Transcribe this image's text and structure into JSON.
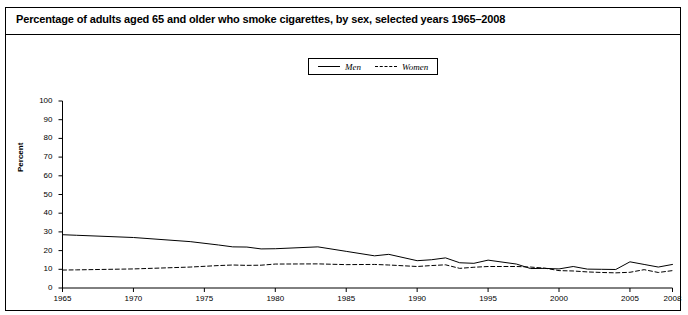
{
  "figure": {
    "title": "Percentage of adults aged 65 and older who smoke cigarettes, by sex, selected years 1965–2008"
  },
  "legend": {
    "position": "top-center",
    "entries": [
      {
        "label": "Men",
        "style": "solid",
        "icon": "solid-line-icon"
      },
      {
        "label": "Women",
        "style": "dashed",
        "icon": "dashed-line-icon"
      }
    ]
  },
  "axes": {
    "ylabel": "Percent",
    "yticks": [
      "0",
      "10",
      "20",
      "30",
      "40",
      "50",
      "60",
      "70",
      "80",
      "90",
      "100"
    ],
    "xticks": [
      "1965",
      "1970",
      "1975",
      "1980",
      "1985",
      "1990",
      "1995",
      "2000",
      "2005",
      "2008"
    ]
  },
  "chart_data": {
    "type": "line",
    "title": "Percentage of adults aged 65 and older who smoke cigarettes, by sex, selected years 1965–2008",
    "xlabel": "",
    "ylabel": "Percent",
    "xlim": [
      1965,
      2008
    ],
    "ylim": [
      0,
      100
    ],
    "ytick_values": [
      0,
      10,
      20,
      30,
      40,
      50,
      60,
      70,
      80,
      90,
      100
    ],
    "xtick_values": [
      1965,
      1970,
      1975,
      1980,
      1985,
      1990,
      1995,
      2000,
      2005,
      2008
    ],
    "grid": false,
    "legend_position": "top-center",
    "x": [
      1965,
      1966,
      1970,
      1974,
      1976,
      1977,
      1978,
      1979,
      1980,
      1983,
      1985,
      1987,
      1988,
      1990,
      1991,
      1992,
      1993,
      1994,
      1995,
      1997,
      1998,
      1999,
      2000,
      2001,
      2002,
      2003,
      2004,
      2005,
      2006,
      2007,
      2008
    ],
    "series": [
      {
        "name": "Men",
        "style": "solid",
        "color": "#000000",
        "values": [
          28.5,
          28.2,
          27.0,
          24.8,
          23.0,
          22.0,
          21.9,
          20.9,
          21.0,
          22.0,
          19.6,
          17.2,
          18.0,
          14.6,
          15.1,
          16.1,
          13.5,
          13.2,
          14.9,
          12.8,
          10.4,
          10.5,
          10.2,
          11.5,
          10.1,
          10.0,
          9.9,
          14.0,
          12.6,
          11.2,
          12.6
        ]
      },
      {
        "name": "Women",
        "style": "dashed",
        "color": "#000000",
        "values": [
          9.6,
          9.7,
          10.2,
          11.2,
          12.0,
          12.3,
          12.1,
          12.2,
          12.8,
          12.9,
          12.5,
          12.6,
          12.3,
          11.5,
          12.0,
          12.4,
          10.5,
          11.1,
          11.5,
          11.5,
          11.2,
          10.6,
          9.3,
          9.1,
          8.6,
          8.3,
          8.1,
          8.4,
          9.8,
          8.3,
          9.3
        ]
      }
    ]
  }
}
